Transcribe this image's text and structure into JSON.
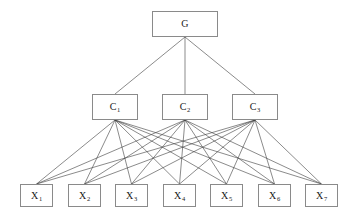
{
  "diagram": {
    "type": "hierarchical-tree",
    "title": "",
    "background_color": "#ffffff",
    "node_border_color": "#8a8a8a",
    "node_fill_color": "#ffffff",
    "edge_color": "#3c3c3c",
    "label_color": "#1a1a1a",
    "levels": [
      {
        "name": "root",
        "nodes": [
          {
            "id": "G",
            "base": "G",
            "sub": "",
            "x": 152,
            "y": 11,
            "w": 66,
            "h": 26
          }
        ]
      },
      {
        "name": "middle",
        "nodes": [
          {
            "id": "C1",
            "base": "C",
            "sub": "1",
            "x": 92,
            "y": 94,
            "w": 46,
            "h": 26
          },
          {
            "id": "C2",
            "base": "C",
            "sub": "2",
            "x": 162,
            "y": 94,
            "w": 46,
            "h": 26
          },
          {
            "id": "C3",
            "base": "C",
            "sub": "3",
            "x": 232,
            "y": 94,
            "w": 46,
            "h": 26
          }
        ]
      },
      {
        "name": "leaf",
        "nodes": [
          {
            "id": "X1",
            "base": "X",
            "sub": "1",
            "x": 20,
            "y": 184,
            "w": 33,
            "h": 23
          },
          {
            "id": "X2",
            "base": "X",
            "sub": "2",
            "x": 68,
            "y": 184,
            "w": 33,
            "h": 23
          },
          {
            "id": "X3",
            "base": "X",
            "sub": "3",
            "x": 115,
            "y": 184,
            "w": 33,
            "h": 23
          },
          {
            "id": "X4",
            "base": "X",
            "sub": "4",
            "x": 163,
            "y": 184,
            "w": 33,
            "h": 23
          },
          {
            "id": "X5",
            "base": "X",
            "sub": "5",
            "x": 210,
            "y": 184,
            "w": 33,
            "h": 23
          },
          {
            "id": "X6",
            "base": "X",
            "sub": "6",
            "x": 258,
            "y": 184,
            "w": 33,
            "h": 23
          },
          {
            "id": "X7",
            "base": "X",
            "sub": "7",
            "x": 305,
            "y": 184,
            "w": 33,
            "h": 23
          }
        ]
      }
    ],
    "edges": [
      {
        "from": "G",
        "to": "C1"
      },
      {
        "from": "G",
        "to": "C2"
      },
      {
        "from": "G",
        "to": "C3"
      },
      {
        "from": "C1",
        "to": "X1"
      },
      {
        "from": "C1",
        "to": "X2"
      },
      {
        "from": "C1",
        "to": "X3"
      },
      {
        "from": "C1",
        "to": "X4"
      },
      {
        "from": "C1",
        "to": "X5"
      },
      {
        "from": "C1",
        "to": "X6"
      },
      {
        "from": "C1",
        "to": "X7"
      },
      {
        "from": "C2",
        "to": "X1"
      },
      {
        "from": "C2",
        "to": "X2"
      },
      {
        "from": "C2",
        "to": "X3"
      },
      {
        "from": "C2",
        "to": "X4"
      },
      {
        "from": "C2",
        "to": "X5"
      },
      {
        "from": "C2",
        "to": "X6"
      },
      {
        "from": "C2",
        "to": "X7"
      },
      {
        "from": "C3",
        "to": "X1"
      },
      {
        "from": "C3",
        "to": "X2"
      },
      {
        "from": "C3",
        "to": "X3"
      },
      {
        "from": "C3",
        "to": "X4"
      },
      {
        "from": "C3",
        "to": "X5"
      },
      {
        "from": "C3",
        "to": "X6"
      },
      {
        "from": "C3",
        "to": "X7"
      }
    ]
  }
}
